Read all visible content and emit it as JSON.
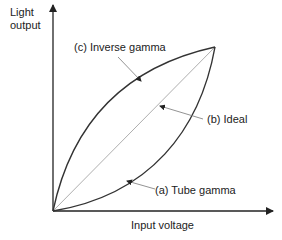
{
  "diagram": {
    "y_axis_label_line1": "Light",
    "y_axis_label_line2": "output",
    "x_axis_label": "Input voltage",
    "curves": [
      {
        "id": "a",
        "label": "(a) Tube gamma"
      },
      {
        "id": "b",
        "label": "(b) Ideal"
      },
      {
        "id": "c",
        "label": "(c) Inverse gamma"
      }
    ],
    "colors": {
      "axis": "#222222",
      "curve": "#333333",
      "ideal": "#999999",
      "leader": "#777777"
    }
  }
}
